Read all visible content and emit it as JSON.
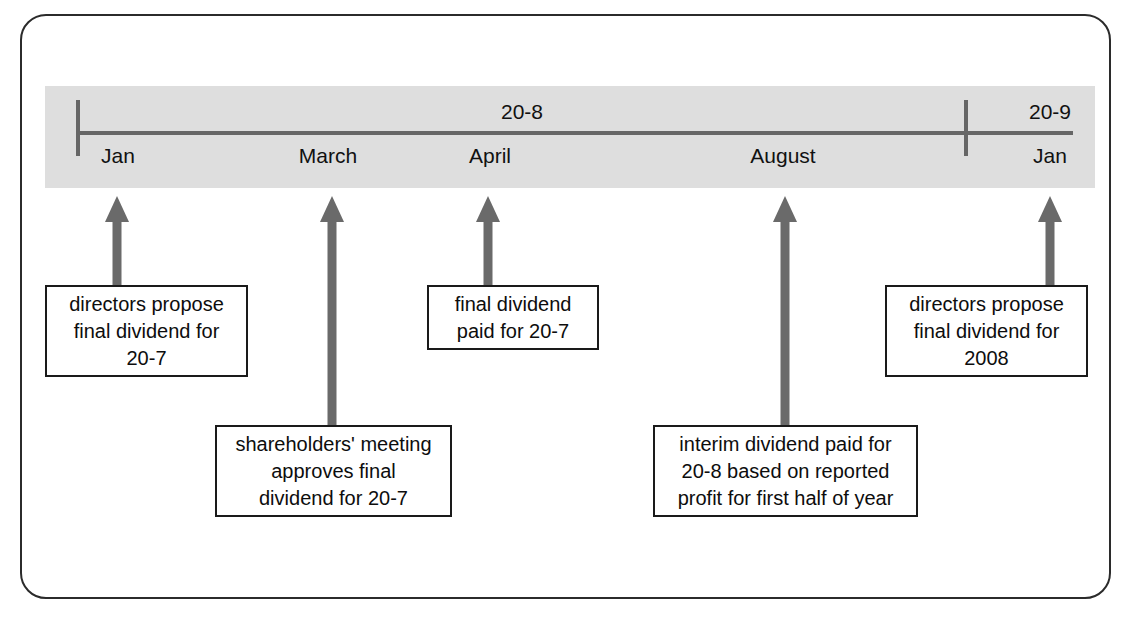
{
  "diagram": {
    "colors": {
      "band": "#dedede",
      "axis": "#666666",
      "arrow": "#6a6a6a",
      "box_border": "#1a1a1a",
      "frame": "#2b2b2b",
      "text": "#0d0d0d"
    },
    "timeline": {
      "years": [
        {
          "label": "20-8"
        },
        {
          "label": "20-9"
        }
      ],
      "months": [
        {
          "label": "Jan"
        },
        {
          "label": "March"
        },
        {
          "label": "April"
        },
        {
          "label": "August"
        },
        {
          "label": "Jan"
        }
      ],
      "ticks": [
        {
          "name": "start-tick"
        },
        {
          "name": "year-boundary-tick"
        }
      ]
    },
    "events": [
      {
        "month": "Jan",
        "text": "directors propose\nfinal dividend for\n20-7"
      },
      {
        "month": "March",
        "text": "shareholders' meeting\napproves final\ndividend for 20-7"
      },
      {
        "month": "April",
        "text": "final dividend\npaid for 20-7"
      },
      {
        "month": "August",
        "text": "interim dividend paid for\n20-8 based on reported\nprofit for first half of year"
      },
      {
        "month": "Jan",
        "text": "directors propose\nfinal dividend for\n2008"
      }
    ]
  }
}
